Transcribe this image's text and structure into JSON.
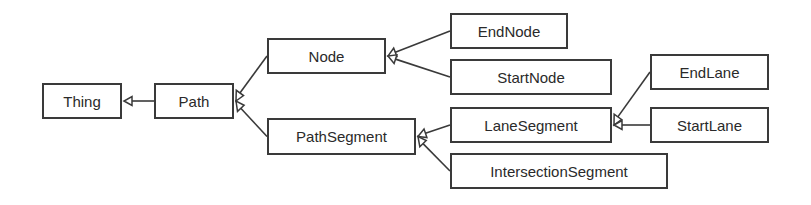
{
  "diagram": {
    "type": "uml-class-hierarchy",
    "colors": {
      "line": "#3a3a3a",
      "text": "#2a2a2a",
      "background": "#ffffff"
    },
    "nodes": [
      {
        "id": "thing",
        "label": "Thing",
        "x": 42,
        "y": 83,
        "w": 80,
        "h": 36
      },
      {
        "id": "path",
        "label": "Path",
        "x": 154,
        "y": 83,
        "w": 80,
        "h": 36
      },
      {
        "id": "node",
        "label": "Node",
        "x": 267,
        "y": 38,
        "w": 119,
        "h": 36
      },
      {
        "id": "pathsegment",
        "label": "PathSegment",
        "x": 267,
        "y": 118,
        "w": 149,
        "h": 37
      },
      {
        "id": "endnode",
        "label": "EndNode",
        "x": 450,
        "y": 13,
        "w": 118,
        "h": 36
      },
      {
        "id": "startnode",
        "label": "StartNode",
        "x": 450,
        "y": 59,
        "w": 162,
        "h": 36
      },
      {
        "id": "lanesegment",
        "label": "LaneSegment",
        "x": 450,
        "y": 107,
        "w": 162,
        "h": 36
      },
      {
        "id": "intersectionsegment",
        "label": "IntersectionSegment",
        "x": 450,
        "y": 153,
        "w": 218,
        "h": 36
      },
      {
        "id": "endlane",
        "label": "EndLane",
        "x": 650,
        "y": 54,
        "w": 119,
        "h": 36
      },
      {
        "id": "startlane",
        "label": "StartLane",
        "x": 650,
        "y": 107,
        "w": 119,
        "h": 36
      }
    ],
    "edges": [
      {
        "from": "path",
        "to": "thing",
        "kind": "generalization"
      },
      {
        "from": "node",
        "to": "path",
        "kind": "generalization"
      },
      {
        "from": "pathsegment",
        "to": "path",
        "kind": "generalization"
      },
      {
        "from": "endnode",
        "to": "node",
        "kind": "generalization"
      },
      {
        "from": "startnode",
        "to": "node",
        "kind": "generalization"
      },
      {
        "from": "lanesegment",
        "to": "pathsegment",
        "kind": "generalization"
      },
      {
        "from": "intersectionsegment",
        "to": "pathsegment",
        "kind": "generalization"
      },
      {
        "from": "endlane",
        "to": "lanesegment",
        "kind": "generalization"
      },
      {
        "from": "startlane",
        "to": "lanesegment",
        "kind": "generalization"
      }
    ]
  }
}
